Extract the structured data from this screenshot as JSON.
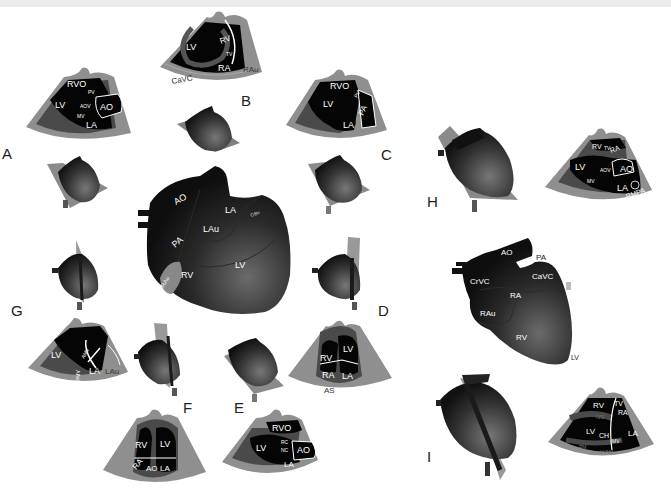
{
  "figure": {
    "views": [
      {
        "id": "A",
        "letter": "A",
        "labels": {
          "rvo": "RVO",
          "pv": "PV",
          "lv": "LV",
          "aov": "AOV",
          "ao": "AO",
          "mv": "MV",
          "la": "LA"
        }
      },
      {
        "id": "B",
        "letter": "B",
        "labels": {
          "lv": "LV",
          "rv": "RV",
          "tv": "TV",
          "ra": "RA",
          "rau": "RAu",
          "cavc": "CaVC"
        }
      },
      {
        "id": "C",
        "letter": "C",
        "labels": {
          "rvo": "RVO",
          "pv": "PV",
          "lv": "LV",
          "pa": "PA",
          "la": "LA"
        }
      },
      {
        "id": "D",
        "letter": "D",
        "labels": {
          "rv": "RV",
          "lv": "LV",
          "ra": "RA",
          "la": "LA",
          "as": "AS"
        }
      },
      {
        "id": "E",
        "letter": "E",
        "labels": {
          "rvo": "RVO",
          "lv": "LV",
          "rc": "RC",
          "nc": "NC",
          "ao": "AO",
          "la": "LA"
        }
      },
      {
        "id": "F",
        "letter": "F",
        "labels": {
          "rv": "RV",
          "lv": "LV",
          "ra": "RA",
          "ao": "AO",
          "la": "LA"
        }
      },
      {
        "id": "G",
        "letter": "G",
        "labels": {
          "lv": "LV",
          "amv": "AMV",
          "pmv": "PMV",
          "la": "LA",
          "lau": "LAu"
        }
      },
      {
        "id": "H",
        "letter": "H",
        "labels": {
          "rv": "RV",
          "tv": "TV",
          "ra": "RA",
          "lv": "LV",
          "aov": "AOV",
          "ao": "AO",
          "mv": "MV",
          "la": "LA",
          "rmpa": "RMPA"
        }
      },
      {
        "id": "I",
        "letter": "I",
        "labels": {
          "rv": "RV",
          "tv": "TV",
          "ra": "RA",
          "ivs": "IVS",
          "lv": "LV",
          "ch": "CH",
          "mv": "MV",
          "la": "LA",
          "pm": "PM",
          "lvw": "LVW"
        }
      }
    ],
    "left_heart": {
      "ao": "AO",
      "la": "LA",
      "gbv": "GBv",
      "lau": "LAu",
      "pa": "PA",
      "lv": "LV",
      "rau": "RAu",
      "rv": "RV"
    },
    "right_heart": {
      "ao": "AO",
      "pa": "PA",
      "crvc": "CrVC",
      "cavc": "CaVC",
      "ra": "RA",
      "rau": "RAu",
      "rv": "RV",
      "lv": "LV"
    },
    "colors": {
      "sector_gray": "#8f8f8f",
      "sector_dark": "#4a4a4a",
      "chamber": "#050505",
      "heart_dark": "#111111",
      "heart_light": "#6a6a6a",
      "plane": "#9a9a9a",
      "text": "#222222"
    }
  }
}
